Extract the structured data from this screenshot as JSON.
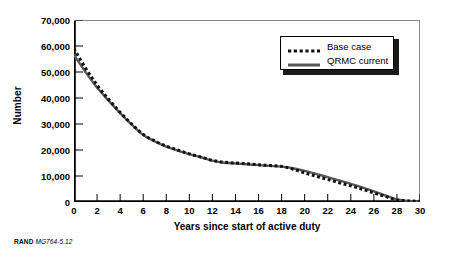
{
  "figure": {
    "footer_mark": "RAND",
    "footer_id": "MG764-5.12"
  },
  "legend": {
    "position": "top-right",
    "entries": [
      {
        "label": "Base case",
        "style": "dotted",
        "color": "#111111",
        "swatch": "dotted-line-swatch"
      },
      {
        "label": "QRMC current",
        "style": "solid",
        "color": "#595959",
        "swatch": "solid-line-swatch"
      }
    ]
  },
  "chart_data": {
    "type": "line",
    "title": "",
    "subtitle": "",
    "xlabel": "Years since start of active duty",
    "ylabel": "Number",
    "xlim": [
      0,
      30
    ],
    "ylim": [
      0,
      70000
    ],
    "grid": false,
    "x_ticks": [
      0,
      2,
      4,
      6,
      8,
      10,
      12,
      14,
      16,
      18,
      20,
      22,
      24,
      26,
      28,
      30
    ],
    "x_tick_labels": [
      "0",
      "2",
      "4",
      "6",
      "8",
      "10",
      "12",
      "14",
      "16",
      "18",
      "20",
      "22",
      "24",
      "26",
      "28",
      "30"
    ],
    "y_ticks": [
      0,
      10000,
      20000,
      30000,
      40000,
      50000,
      60000,
      70000
    ],
    "y_tick_labels": [
      "0",
      "10,000",
      "20,000",
      "30,000",
      "40,000",
      "50,000",
      "60,000",
      "70,000"
    ],
    "x": [
      0,
      1,
      2,
      3,
      4,
      5,
      6,
      7,
      8,
      9,
      10,
      11,
      12,
      13,
      14,
      15,
      16,
      17,
      18,
      19,
      20,
      21,
      22,
      23,
      24,
      25,
      26,
      27,
      28,
      29,
      30
    ],
    "series": [
      {
        "name": "Base case",
        "style": "dotted",
        "color": "#111111",
        "width": 3.0,
        "values": [
          59000,
          51500,
          45000,
          39500,
          34500,
          30000,
          26000,
          23500,
          21500,
          20000,
          18500,
          17300,
          16000,
          15300,
          15000,
          14700,
          14300,
          14000,
          13700,
          12600,
          11200,
          9900,
          8700,
          7400,
          6200,
          4900,
          3500,
          2100,
          800,
          400,
          300
        ]
      },
      {
        "name": "QRMC current",
        "style": "solid",
        "color": "#595959",
        "width": 2.4,
        "values": [
          56500,
          50000,
          44000,
          39000,
          34200,
          29800,
          25800,
          23300,
          21300,
          19800,
          18400,
          17200,
          15900,
          15100,
          14800,
          14500,
          14200,
          13900,
          13600,
          13000,
          12000,
          10800,
          9600,
          8300,
          7000,
          5600,
          4100,
          2500,
          1000,
          400,
          200
        ]
      }
    ]
  }
}
